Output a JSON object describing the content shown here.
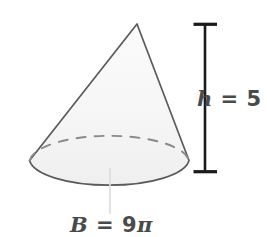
{
  "figure": {
    "type": "cone-geometry-diagram",
    "shape_name": "cone",
    "background_color": "#ffffff",
    "outline_color": "#5a5a5a",
    "fill_color": "#f4f4f4",
    "label_color": "#4a4a4a",
    "measure_bar_color": "#1a1a1a",
    "leader_line_color": "#d8d8d8"
  },
  "labels": {
    "height": {
      "variable": "h",
      "equals": " = ",
      "value": "5",
      "full_text": "h = 5"
    },
    "base": {
      "variable": "B",
      "equals": " = ",
      "value": "9",
      "unit_symbol": "π",
      "full_text": "B = 9π"
    }
  },
  "geometry": {
    "apex": {
      "x": 137,
      "y": 24
    },
    "base_center": {
      "x": 109,
      "y": 167
    },
    "base_radius_x": 80,
    "base_radius_y": 27,
    "height_bar": {
      "x": 205,
      "top_y": 24,
      "bottom_y": 172,
      "cap_half_width": 12
    }
  }
}
